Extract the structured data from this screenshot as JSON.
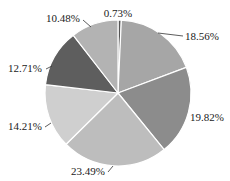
{
  "chart_data": {
    "type": "pie",
    "title": "",
    "start_angle_deg": 0,
    "direction": "clockwise",
    "slices": [
      {
        "label": "0.73%",
        "value": 0.73,
        "color": "#555555"
      },
      {
        "label": "18.56%",
        "value": 18.56,
        "color": "#a6a6a6"
      },
      {
        "label": "19.82%",
        "value": 19.82,
        "color": "#8c8c8c"
      },
      {
        "label": "23.49%",
        "value": 23.49,
        "color": "#bdbdbd"
      },
      {
        "label": "14.21%",
        "value": 14.21,
        "color": "#cfcfcf"
      },
      {
        "label": "12.71%",
        "value": 12.71,
        "color": "#5e5e5e"
      },
      {
        "label": "10.48%",
        "value": 10.48,
        "color": "#b3b3b3"
      }
    ],
    "labels_positions": [
      {
        "text": "0.73%",
        "x": 118,
        "y": 17,
        "anchor": "middle",
        "leader": null
      },
      {
        "text": "18.56%",
        "x": 185,
        "y": 40,
        "anchor": "start",
        "leader": [
          158,
          33,
          183,
          36
        ]
      },
      {
        "text": "19.82%",
        "x": 190,
        "y": 121,
        "anchor": "start",
        "leader": null
      },
      {
        "text": "23.49%",
        "x": 105,
        "y": 175,
        "anchor": "end",
        "leader": [
          108,
          172,
          113,
          166
        ]
      },
      {
        "text": "14.21%",
        "x": 42,
        "y": 130,
        "anchor": "end",
        "leader": [
          45,
          127,
          51,
          123
        ]
      },
      {
        "text": "12.71%",
        "x": 42,
        "y": 72,
        "anchor": "end",
        "leader": [
          46,
          69,
          52,
          66
        ]
      },
      {
        "text": "10.48%",
        "x": 80,
        "y": 22,
        "anchor": "end",
        "leader": [
          83,
          20,
          91,
          27
        ]
      }
    ],
    "center": [
      118,
      93
    ],
    "radius": 73,
    "legend": null
  }
}
